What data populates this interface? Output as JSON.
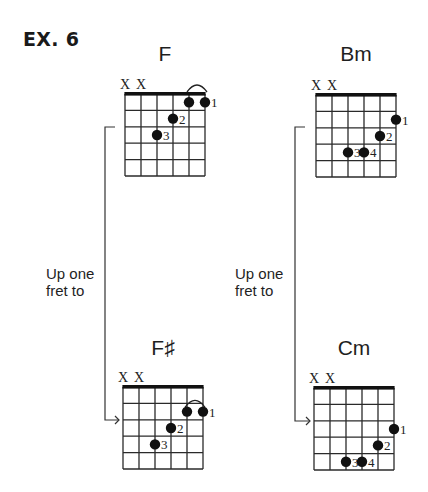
{
  "title": "EX. 6",
  "colors": {
    "ink": "#1f1f1f",
    "grid": "#2a2a2a",
    "background": "#ffffff"
  },
  "transitions": [
    {
      "label_line1": "Up one",
      "label_line2": "fret to",
      "from": "F",
      "to": "F♯"
    },
    {
      "label_line1": "Up one",
      "label_line2": "fret to",
      "from": "Bm",
      "to": "Cm"
    }
  ],
  "chords": [
    {
      "name": "F",
      "muted_strings": [
        1,
        2
      ],
      "mute_symbol": "X",
      "start_fret_offset": 0,
      "barre_arc": {
        "from_string": 5,
        "to_string": 6
      },
      "dots": [
        {
          "string": 5,
          "fret": 1,
          "finger": ""
        },
        {
          "string": 6,
          "fret": 1,
          "finger": "1"
        },
        {
          "string": 4,
          "fret": 2,
          "finger": "2"
        },
        {
          "string": 3,
          "fret": 3,
          "finger": "3"
        }
      ]
    },
    {
      "name": "Bm",
      "muted_strings": [
        1,
        2
      ],
      "mute_symbol": "X",
      "start_fret_offset": 0,
      "barre_arc": null,
      "dots": [
        {
          "string": 6,
          "fret": 2,
          "finger": "1"
        },
        {
          "string": 5,
          "fret": 3,
          "finger": "2"
        },
        {
          "string": 3,
          "fret": 4,
          "finger": "3"
        },
        {
          "string": 4,
          "fret": 4,
          "finger": "4"
        }
      ]
    },
    {
      "name": "F♯",
      "muted_strings": [
        1,
        2
      ],
      "mute_symbol": "X",
      "start_fret_offset": 0,
      "barre_arc": {
        "from_string": 5,
        "to_string": 6
      },
      "dots": [
        {
          "string": 5,
          "fret": 2,
          "finger": ""
        },
        {
          "string": 6,
          "fret": 2,
          "finger": "1"
        },
        {
          "string": 4,
          "fret": 3,
          "finger": "2"
        },
        {
          "string": 3,
          "fret": 4,
          "finger": "3"
        }
      ]
    },
    {
      "name": "Cm",
      "muted_strings": [
        1,
        2
      ],
      "mute_symbol": "X",
      "start_fret_offset": 0,
      "barre_arc": null,
      "dots": [
        {
          "string": 6,
          "fret": 3,
          "finger": "1"
        },
        {
          "string": 5,
          "fret": 4,
          "finger": "2"
        },
        {
          "string": 3,
          "fret": 5,
          "finger": "3"
        },
        {
          "string": 4,
          "fret": 5,
          "finger": "4"
        }
      ]
    }
  ]
}
